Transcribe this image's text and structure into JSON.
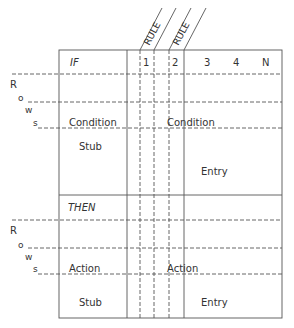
{
  "diagram": {
    "type": "decision-table-layout",
    "header": {
      "if_label": "IF",
      "rule_labels": [
        "RULE",
        "RULE"
      ],
      "rule_numbers": [
        "1",
        "2",
        "3",
        "4",
        "N"
      ]
    },
    "side_labels": {
      "condition_rows": [
        "R",
        "o",
        "w",
        "s"
      ],
      "action_rows": [
        "R",
        "o",
        "w",
        "s"
      ]
    },
    "condition_section": {
      "stub_label_1": "Condition",
      "stub_label_2": "Stub",
      "entry_label_1": "Condition",
      "entry_label_2": "Entry"
    },
    "then_label": "THEN",
    "action_section": {
      "stub_label_1": "Action",
      "stub_label_2": "Stub",
      "entry_label_1": "Action",
      "entry_label_2": "Entry"
    },
    "colors": {
      "line": "#555555",
      "text": "#333333",
      "background": "#ffffff"
    }
  }
}
